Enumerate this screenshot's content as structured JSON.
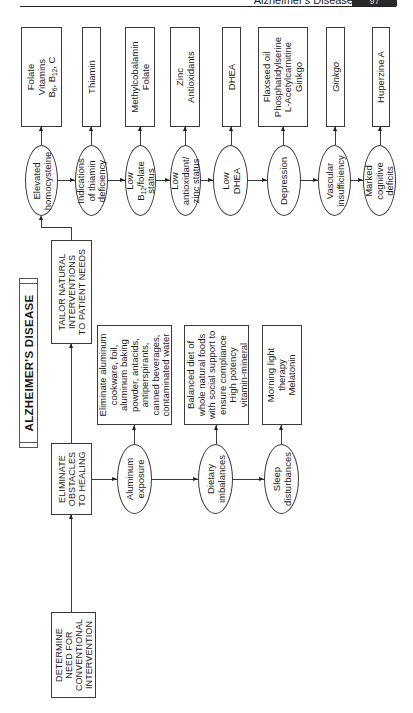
{
  "header": {
    "running_title": "Alzheimer's Disease",
    "page_number": "97"
  },
  "title": "ALZHEIMER'S DISEASE",
  "steps": {
    "determine": [
      "DETERMINE",
      "NEED FOR",
      "CONVENTIONAL",
      "INTERVENTION"
    ],
    "eliminate": [
      "ELIMINATE",
      "OBSTACLES",
      "TO HEALING"
    ],
    "tailor": [
      "TAILOR NATURAL",
      "INTERVENTIONS",
      "TO PATIENT NEEDS"
    ]
  },
  "obstacles": [
    {
      "condition": [
        "Aluminum",
        "exposure"
      ],
      "intervention": [
        "Eliminate aluminum",
        "cookware, foil,",
        "aluminum baking",
        "powder, antacids,",
        "antiperspirants,",
        "canned beverages,",
        "contaminated water"
      ]
    },
    {
      "condition": [
        "Dietary",
        "imbalances"
      ],
      "intervention": [
        "Balanced diet of",
        "whole natural foods",
        "with social support to",
        "ensure compliance",
        "High potency",
        "vitamin-mineral"
      ]
    },
    {
      "condition": [
        "Sleep",
        "disturbances"
      ],
      "intervention": [
        "Morning light",
        "therapy",
        "Melatonin"
      ]
    }
  ],
  "natural_interventions": [
    {
      "condition": [
        "Elevated",
        "homocysteine"
      ],
      "intervention": [
        "Folate",
        "Vitamins",
        "B6, B12, C"
      ]
    },
    {
      "condition": [
        "Indications",
        "of thiamin",
        "deficiency"
      ],
      "intervention": [
        "Thiamin"
      ]
    },
    {
      "condition": [
        "Low",
        "B12/folate",
        "status"
      ],
      "intervention": [
        "Methylcobalamin",
        "Folate"
      ]
    },
    {
      "condition": [
        "Low",
        "antioxidant/",
        "zinc status"
      ],
      "intervention": [
        "Zinc",
        "Antioxidants"
      ]
    },
    {
      "condition": [
        "Low",
        "DHEA"
      ],
      "intervention": [
        "DHEA"
      ]
    },
    {
      "condition": [
        "Depression"
      ],
      "intervention": [
        "Flaxseed oil",
        "Phosphatidylserine",
        "L-Acetylcarnitine",
        "Ginkgo"
      ]
    },
    {
      "condition": [
        "Vascular",
        "insufficiency"
      ],
      "intervention": [
        "Ginkgo"
      ]
    },
    {
      "condition": [
        "Marked",
        "cognitive",
        "deficits"
      ],
      "intervention": [
        "Huperzine A"
      ]
    }
  ]
}
